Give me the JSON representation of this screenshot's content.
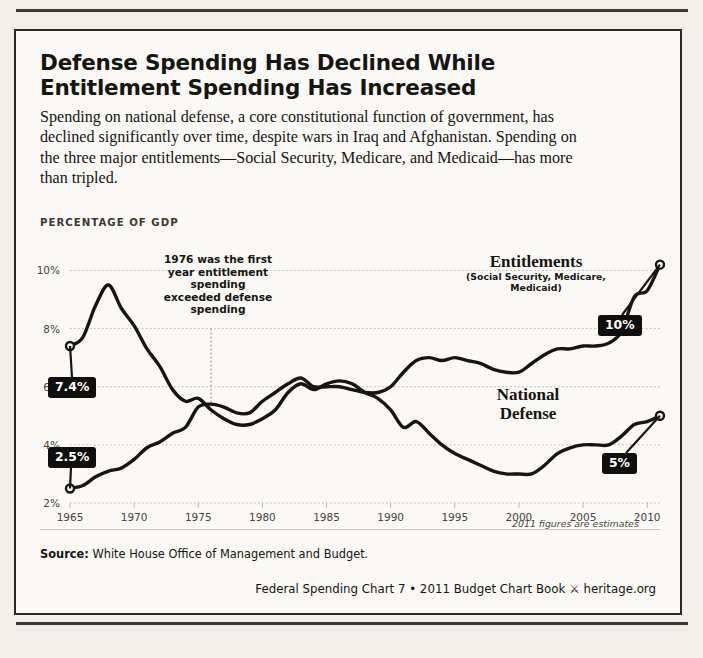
{
  "headline": "Defense Spending Has Declined While Entitlement Spending Has Increased",
  "deck": "Spending on national defense, a core constitutional function of government, has declined significantly over time, despite wars in Iraq and Afghanistan. Spending on the three major entitlements—Social Security, Medicare, and Medicaid—has more than tripled.",
  "axis_title": "PERCENTAGE OF GDP",
  "annotation": "1976 was the first year entitlement spending exceeded defense spending",
  "estimate_note": "2011 figures are estimates",
  "source_label": "Source:",
  "source_text": "White House Office of Management and Budget.",
  "credit": "Federal Spending Chart 7 • 2011 Budget Chart Book",
  "credit_site": "heritage.org",
  "colors": {
    "ink": "#16150f",
    "paper": "#faf9f5",
    "grid": "#b9b6ab",
    "callout_bg": "#100f0b",
    "callout_fg": "#ffffff"
  },
  "chart_data": {
    "type": "line",
    "title": "Defense Spending Has Declined While Entitlement Spending Has Increased",
    "xlabel": "",
    "ylabel": "PERCENTAGE OF GDP",
    "xlim": [
      1965,
      2011
    ],
    "ylim": [
      2,
      10.6
    ],
    "yticks": [
      2,
      4,
      6,
      8,
      10
    ],
    "ytick_labels": [
      "2%",
      "4%",
      "6%",
      "8%",
      "10%"
    ],
    "xticks": [
      1965,
      1970,
      1975,
      1980,
      1985,
      1990,
      1995,
      2000,
      2005,
      2010
    ],
    "xtick_labels": [
      "1965",
      "1970",
      "1975",
      "1980",
      "1985",
      "1990",
      "1995",
      "2000",
      "2005",
      "2010"
    ],
    "grid": true,
    "legend": "inline-labels",
    "x": [
      1965,
      1966,
      1967,
      1968,
      1969,
      1970,
      1971,
      1972,
      1973,
      1974,
      1975,
      1976,
      1977,
      1978,
      1979,
      1980,
      1981,
      1982,
      1983,
      1984,
      1985,
      1986,
      1987,
      1988,
      1989,
      1990,
      1991,
      1992,
      1993,
      1994,
      1995,
      1996,
      1997,
      1998,
      1999,
      2000,
      2001,
      2002,
      2003,
      2004,
      2005,
      2006,
      2007,
      2008,
      2009,
      2010,
      2011
    ],
    "series": [
      {
        "name": "National Defense",
        "label": "National Defense",
        "sublabel": "",
        "endpoint_callout": "5%",
        "start_callout": "7.4%",
        "values": [
          7.4,
          7.7,
          8.8,
          9.5,
          8.7,
          8.1,
          7.3,
          6.7,
          5.9,
          5.5,
          5.6,
          5.2,
          4.9,
          4.7,
          4.7,
          4.9,
          5.2,
          5.8,
          6.1,
          5.9,
          6.1,
          6.2,
          6.1,
          5.8,
          5.6,
          5.2,
          4.6,
          4.8,
          4.4,
          4.0,
          3.7,
          3.5,
          3.3,
          3.1,
          3.0,
          3.0,
          3.0,
          3.3,
          3.7,
          3.9,
          4.0,
          4.0,
          4.0,
          4.3,
          4.7,
          4.8,
          5.0
        ]
      },
      {
        "name": "Entitlements",
        "label": "Entitlements",
        "sublabel": "(Social Security, Medicare, Medicaid)",
        "endpoint_callout": "10%",
        "start_callout": "2.5%",
        "values": [
          2.5,
          2.6,
          2.9,
          3.1,
          3.2,
          3.5,
          3.9,
          4.1,
          4.4,
          4.6,
          5.3,
          5.4,
          5.3,
          5.1,
          5.1,
          5.5,
          5.8,
          6.1,
          6.3,
          6.0,
          6.0,
          6.0,
          5.9,
          5.8,
          5.8,
          6.0,
          6.5,
          6.9,
          7.0,
          6.9,
          7.0,
          6.9,
          6.8,
          6.6,
          6.5,
          6.5,
          6.8,
          7.1,
          7.3,
          7.3,
          7.4,
          7.4,
          7.5,
          7.9,
          9.1,
          9.3,
          10.2
        ]
      }
    ]
  }
}
